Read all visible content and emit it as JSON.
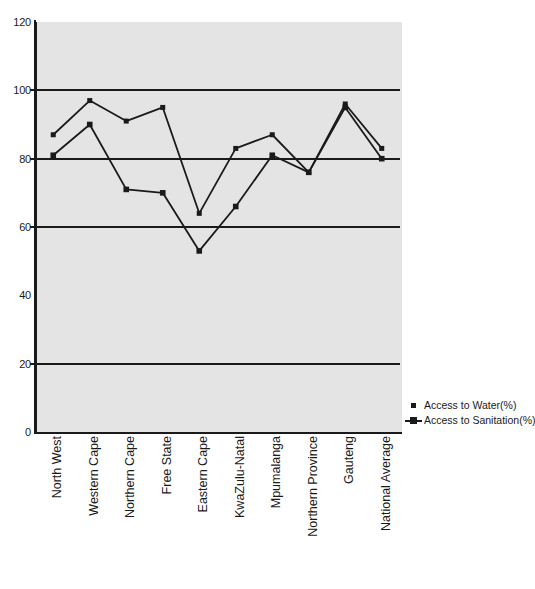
{
  "chart_data": {
    "type": "line",
    "title": "",
    "xlabel": "",
    "ylabel": "",
    "ylim": [
      0,
      120
    ],
    "yticks": [
      0,
      20,
      40,
      60,
      80,
      100,
      120
    ],
    "gridlines": [
      20,
      60,
      80,
      100
    ],
    "grid": true,
    "legend_position": "right",
    "plot_background": "#e4e4e4",
    "line_color": "#1a1a1a",
    "categories": [
      "North West",
      "Western Cape",
      "Northern Cape",
      "Free State",
      "Eastern Cape",
      "KwaZulu-Natal",
      "Mpumalanga",
      "Northern Province",
      "Gauteng",
      "National Average"
    ],
    "series": [
      {
        "name": "Access to Water(%)",
        "marker": "square",
        "values": [
          87,
          97,
          91,
          95,
          64,
          83,
          87,
          76,
          96,
          83
        ]
      },
      {
        "name": "Access to Sanitation(%)",
        "marker": "square-line",
        "values": [
          81,
          90,
          71,
          70,
          53,
          66,
          81,
          76,
          95,
          80
        ]
      }
    ]
  },
  "axis": {
    "y_tick_labels": [
      "0",
      "20",
      "40",
      "60",
      "80",
      "100",
      "120"
    ]
  },
  "legend": {
    "items": [
      {
        "label": "Access to Water(%)"
      },
      {
        "label": "Access to Sanitation(%)"
      }
    ]
  }
}
